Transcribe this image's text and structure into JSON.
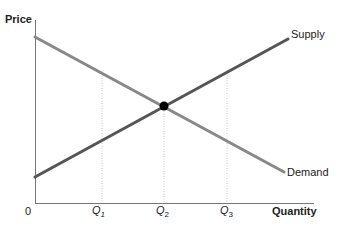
{
  "diagram": {
    "y_axis_label": "Price",
    "x_axis_label": "Quantity",
    "origin_label": "0",
    "curves": [
      {
        "name": "Supply",
        "color": "#555555"
      },
      {
        "name": "Demand",
        "color": "#888888"
      }
    ],
    "quantity_marks": [
      {
        "letter": "Q",
        "sub": "1"
      },
      {
        "letter": "Q",
        "sub": "2"
      },
      {
        "letter": "Q",
        "sub": "3"
      }
    ],
    "equilibrium": {
      "label": "equilibrium point"
    }
  }
}
